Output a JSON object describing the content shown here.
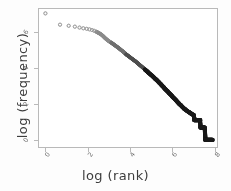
{
  "chart_data": {
    "type": "scatter",
    "title": "",
    "xlabel": "log (rank)",
    "ylabel": "log (frequency)",
    "xlim": [
      -0.35,
      8.15
    ],
    "ylim": [
      -0.45,
      7.35
    ],
    "xticks": [
      0,
      2,
      4,
      6,
      8
    ],
    "xtick_labels": [
      "0",
      "2",
      "4",
      "6",
      "8"
    ],
    "yticks": [
      0,
      2,
      4,
      6
    ],
    "ytick_labels": [
      "0",
      "2",
      "4",
      "6"
    ],
    "grid": false,
    "legend": null,
    "marker": "open-circle",
    "marker_color": "#1a1a1a",
    "frame_color": "#b9b9b9",
    "background": "#ffffff",
    "series": [
      {
        "name": "word frequency",
        "points": [
          [
            0.0,
            7.05
          ],
          [
            0.69,
            6.42
          ],
          [
            1.1,
            6.36
          ],
          [
            1.39,
            6.31
          ],
          [
            1.61,
            6.26
          ],
          [
            1.79,
            6.22
          ],
          [
            1.95,
            6.19
          ],
          [
            2.08,
            6.16
          ],
          [
            2.2,
            6.12
          ],
          [
            2.3,
            6.08
          ],
          [
            2.4,
            6.03
          ],
          [
            2.48,
            5.98
          ],
          [
            2.56,
            5.93
          ],
          [
            2.64,
            5.87
          ],
          [
            2.71,
            5.8
          ],
          [
            2.77,
            5.73
          ],
          [
            2.83,
            5.66
          ],
          [
            2.89,
            5.6
          ],
          [
            2.94,
            5.55
          ],
          [
            3.0,
            5.5
          ],
          [
            3.09,
            5.43
          ],
          [
            3.18,
            5.36
          ],
          [
            3.26,
            5.29
          ],
          [
            3.33,
            5.23
          ],
          [
            3.4,
            5.17
          ],
          [
            3.47,
            5.11
          ],
          [
            3.53,
            5.05
          ],
          [
            3.58,
            5.0
          ],
          [
            3.64,
            4.95
          ],
          [
            3.69,
            4.9
          ],
          [
            3.74,
            4.85
          ],
          [
            3.78,
            4.8
          ],
          [
            3.83,
            4.75
          ],
          [
            3.91,
            4.68
          ],
          [
            4.0,
            4.6
          ],
          [
            4.09,
            4.52
          ],
          [
            4.17,
            4.45
          ],
          [
            4.25,
            4.38
          ],
          [
            4.32,
            4.31
          ],
          [
            4.38,
            4.25
          ],
          [
            4.44,
            4.19
          ],
          [
            4.5,
            4.13
          ],
          [
            4.56,
            4.07
          ],
          [
            4.61,
            4.02
          ],
          [
            4.66,
            3.97
          ],
          [
            4.7,
            3.92
          ],
          [
            4.74,
            3.88
          ],
          [
            4.79,
            3.83
          ],
          [
            4.83,
            3.79
          ],
          [
            4.87,
            3.74
          ],
          [
            4.94,
            3.67
          ],
          [
            5.01,
            3.6
          ],
          [
            5.08,
            3.53
          ],
          [
            5.14,
            3.46
          ],
          [
            5.19,
            3.4
          ],
          [
            5.25,
            3.34
          ],
          [
            5.3,
            3.28
          ],
          [
            5.35,
            3.22
          ],
          [
            5.39,
            3.17
          ],
          [
            5.44,
            3.11
          ],
          [
            5.48,
            3.06
          ],
          [
            5.52,
            3.01
          ],
          [
            5.56,
            2.96
          ],
          [
            5.6,
            2.91
          ],
          [
            5.63,
            2.86
          ],
          [
            5.7,
            2.78
          ],
          [
            5.77,
            2.7
          ],
          [
            5.83,
            2.62
          ],
          [
            5.89,
            2.55
          ],
          [
            5.95,
            2.48
          ],
          [
            6.0,
            2.41
          ],
          [
            6.05,
            2.35
          ],
          [
            6.1,
            2.29
          ],
          [
            6.15,
            2.23
          ],
          [
            6.19,
            2.18
          ],
          [
            6.23,
            2.12
          ],
          [
            6.27,
            2.07
          ],
          [
            6.31,
            2.02
          ],
          [
            6.35,
            1.97
          ],
          [
            6.4,
            1.92
          ],
          [
            6.45,
            1.86
          ],
          [
            6.5,
            1.8
          ],
          [
            6.55,
            1.74
          ],
          [
            6.6,
            1.7
          ],
          [
            6.65,
            1.65
          ],
          [
            6.7,
            1.61
          ],
          [
            6.75,
            1.57
          ],
          [
            6.8,
            1.53
          ],
          [
            6.85,
            1.49
          ],
          [
            6.9,
            1.45
          ],
          [
            6.95,
            1.41
          ],
          [
            7.0,
            1.39
          ],
          [
            7.05,
            1.1
          ],
          [
            7.1,
            1.1
          ],
          [
            7.15,
            1.1
          ],
          [
            7.2,
            1.1
          ],
          [
            7.25,
            1.1
          ],
          [
            7.3,
            1.1
          ],
          [
            7.33,
            0.69
          ],
          [
            7.38,
            0.69
          ],
          [
            7.43,
            0.69
          ],
          [
            7.48,
            0.69
          ],
          [
            7.52,
            0.69
          ],
          [
            7.56,
            0.0
          ],
          [
            7.6,
            0.0
          ],
          [
            7.64,
            0.0
          ],
          [
            7.68,
            0.0
          ],
          [
            7.72,
            0.0
          ],
          [
            7.76,
            0.0
          ],
          [
            7.8,
            0.0
          ],
          [
            7.84,
            0.0
          ],
          [
            7.88,
            0.0
          ]
        ]
      }
    ]
  }
}
